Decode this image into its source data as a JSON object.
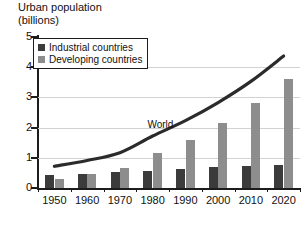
{
  "chart_data": {
    "type": "bar",
    "title": "Urban population",
    "subtitle": "(billions)",
    "title_lines": [
      "Urban population",
      "(billions)"
    ],
    "xlabel": "",
    "ylabel": "billions",
    "ylim": [
      0,
      5
    ],
    "ytick_labels": [
      "0",
      "1",
      "2",
      "3",
      "4",
      "5"
    ],
    "ytick_values": [
      0,
      1,
      2,
      3,
      4,
      5
    ],
    "grid": "horizontal",
    "gridlines_at": [
      1,
      2,
      3,
      4
    ],
    "legend_position": "upper-left",
    "categories": [
      "1950",
      "1960",
      "1970",
      "1980",
      "1990",
      "2000",
      "2010",
      "2020"
    ],
    "series": [
      {
        "name": "Industrial countries",
        "color": "#3b3b3b",
        "values": [
          0.42,
          0.46,
          0.52,
          0.57,
          0.63,
          0.68,
          0.73,
          0.77
        ]
      },
      {
        "name": "Developing countries",
        "color": "#8d8d8d",
        "values": [
          0.3,
          0.45,
          0.65,
          1.15,
          1.6,
          2.15,
          2.8,
          3.6
        ]
      }
    ],
    "overlay_line": {
      "name": "World",
      "color": "#2b2b2b",
      "label": "World",
      "x": [
        "1950",
        "1960",
        "1970",
        "1980",
        "1990",
        "2000",
        "2010",
        "2020"
      ],
      "values": [
        0.72,
        0.91,
        1.17,
        1.72,
        2.23,
        2.83,
        3.53,
        4.37
      ]
    },
    "annotations": [
      {
        "text": "World",
        "x": "1985",
        "y": 2.05
      }
    ]
  },
  "legend": {
    "entries": [
      {
        "label": "Industrial countries",
        "swatch": "legend-swatch-industrial"
      },
      {
        "label": "Developing countries",
        "swatch": "legend-swatch-developing"
      }
    ]
  },
  "colors": {
    "industrial": "#3b3b3b",
    "developing": "#8d8d8d",
    "world_line": "#2b2b2b",
    "axis": "#1c1c1c",
    "grid": "#d2d2d2",
    "background": "#ffffff"
  }
}
